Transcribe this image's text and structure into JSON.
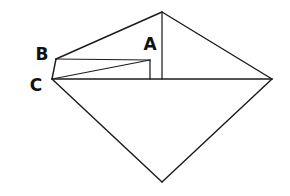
{
  "figure": {
    "background_color": "#ffffff",
    "stroke_color": "#1c1c1c",
    "label_color": "#111111",
    "canvas": {
      "width": 290,
      "height": 196
    }
  },
  "labels": {
    "a": "A",
    "b": "B",
    "c": "C"
  },
  "label_positions": {
    "a": {
      "x": 150,
      "y": 45
    },
    "b": {
      "x": 42,
      "y": 55
    },
    "c": {
      "x": 36,
      "y": 86
    }
  },
  "points": {
    "apex_top": {
      "x": 162,
      "y": 12
    },
    "vertex_right": {
      "x": 272,
      "y": 79
    },
    "vertex_bottom": {
      "x": 162,
      "y": 182
    },
    "point_c": {
      "x": 52,
      "y": 79
    },
    "point_b": {
      "x": 56,
      "y": 59
    },
    "point_a": {
      "x": 150,
      "y": 60
    },
    "foot_a": {
      "x": 150,
      "y": 79
    },
    "foot_apex": {
      "x": 162,
      "y": 79
    }
  },
  "segments": [
    {
      "name": "edge-b-to-apex",
      "from": "point_b",
      "to": "apex_top"
    },
    {
      "name": "edge-apex-to-right",
      "from": "apex_top",
      "to": "vertex_right"
    },
    {
      "name": "edge-right-to-bottom",
      "from": "vertex_right",
      "to": "vertex_bottom"
    },
    {
      "name": "edge-bottom-to-c",
      "from": "vertex_bottom",
      "to": "point_c"
    },
    {
      "name": "edge-c-to-b",
      "from": "point_c",
      "to": "point_b"
    },
    {
      "name": "baseline-c-to-right",
      "from": "point_c",
      "to": "vertex_right"
    },
    {
      "name": "altitude-apex-to-base",
      "from": "apex_top",
      "to": "foot_apex"
    },
    {
      "name": "segment-b-to-a",
      "from": "point_b",
      "to": "point_a"
    },
    {
      "name": "segment-c-to-a",
      "from": "point_c",
      "to": "point_a"
    },
    {
      "name": "altitude-a-to-base",
      "from": "point_a",
      "to": "foot_a"
    }
  ]
}
